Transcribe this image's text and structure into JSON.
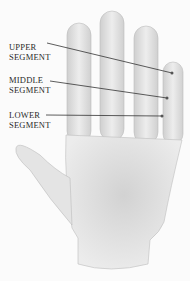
{
  "diagram": {
    "labels": [
      {
        "line1": "UPPER",
        "line2": "SEGMENT"
      },
      {
        "line1": "MIDDLE",
        "line2": "SEGMENT"
      },
      {
        "line1": "LOWER",
        "line2": "SEGMENT"
      }
    ],
    "colors": {
      "skin": "#e6e6e6",
      "shadow": "#c4c4c4",
      "line": "#333333",
      "background": "#fbfbfb"
    }
  }
}
